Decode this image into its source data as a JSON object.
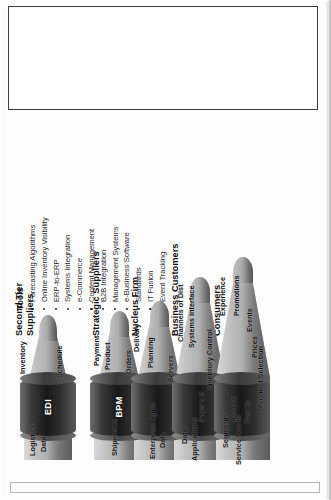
{
  "tools_panel": {
    "title": "Tools",
    "items": [
      "Forecasting Algorithms",
      "Online Inventory Visibility",
      "ERP-to-ERP",
      "Systems Integration",
      "e-Commerce",
      "Content Management",
      "B2B Integration",
      "Management Systems",
      "e-Business Software",
      "Standards",
      "IT Fusion",
      "Event Tracking"
    ]
  },
  "diagram": {
    "tiers": [
      {
        "id": "second-tier-suppliers",
        "label_line1": "Second Tier",
        "label_line2": "Suppliers"
      },
      {
        "id": "strategic-suppliers",
        "label_line1": "Strategic Suppliers",
        "label_line2": ""
      },
      {
        "id": "nucleus-firm",
        "label_line1": "Nucleus Firm",
        "label_line2": ""
      },
      {
        "id": "business-customers",
        "label_line1": "Business Customers",
        "label_line2": ""
      },
      {
        "id": "consumers",
        "label_line1": "Consumers",
        "label_line2": ""
      }
    ],
    "cylinders": [
      {
        "id": "edi",
        "label": "EDI"
      },
      {
        "id": "bpm",
        "label": "BPM"
      },
      {
        "id": "cyl-3",
        "label": ""
      },
      {
        "id": "cyl-4",
        "label": ""
      },
      {
        "id": "cyl-5",
        "label": ""
      }
    ],
    "cones": [
      {
        "id": "cone-1",
        "upper_words": [
          "Inventory",
          "Schedule"
        ],
        "lower_words": [
          "Logistics",
          "Data"
        ]
      },
      {
        "id": "cone-2",
        "upper_words": [
          "Payment",
          "Product",
          "Orders"
        ],
        "lower_words": [
          "Shipments"
        ]
      },
      {
        "id": "cone-3",
        "upper_words": [
          "Delivery",
          "Planning",
          "Servers"
        ],
        "lower_words": [
          "Enterprise Apps",
          "Data"
        ]
      },
      {
        "id": "cone-4",
        "upper_words": [
          "Channels of Dist",
          "Systems Interface",
          "Inventory Control"
        ],
        "lower_words": [
          "Applications",
          "Data",
          "Payment"
        ]
      },
      {
        "id": "cone-5",
        "upper_words": [
          "Experience",
          "Promotions",
          "Events",
          "Prices",
          "Product Selection"
        ],
        "lower_words": [
          "Service Needs",
          "Segments",
          "Access",
          "Trends"
        ]
      }
    ]
  },
  "colors": {
    "cone_light": "#d9d9d9",
    "cone_mid": "#a8a8a8",
    "cylinder_dark": "#181818",
    "text": "#1a1a1a",
    "panel_border": "#3d3d3d"
  }
}
